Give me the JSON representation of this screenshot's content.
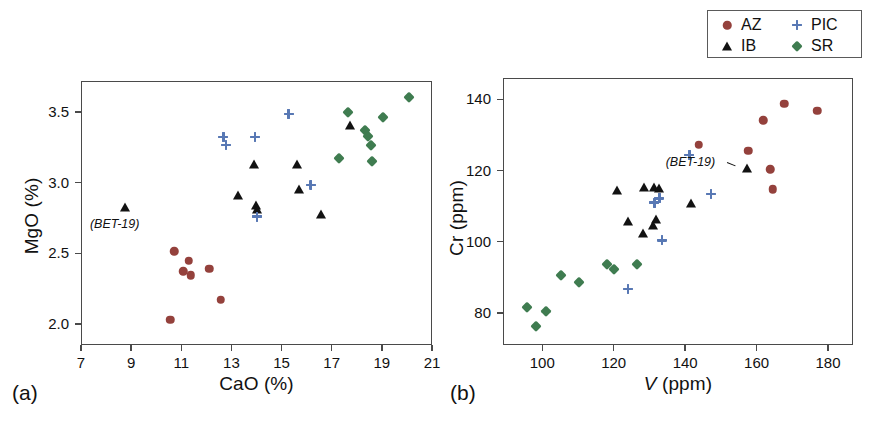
{
  "figure": {
    "panel_labels": {
      "a": "(a)",
      "b": "(b)"
    }
  },
  "legend": {
    "position": "top-right",
    "entries": [
      {
        "label": "AZ",
        "marker": "circle",
        "color": "#94413c"
      },
      {
        "label": "PIC",
        "marker": "plus",
        "color": "#5878b4"
      },
      {
        "label": "IB",
        "marker": "triangle",
        "color": "#121212"
      },
      {
        "label": "SR",
        "marker": "diamond",
        "color": "#3f7c50"
      }
    ]
  },
  "chart_data": [
    {
      "panel": "(a)",
      "type": "scatter",
      "title": "",
      "xlabel": "CaO (%)",
      "ylabel": "MgO (%)",
      "xlim": [
        7,
        21
      ],
      "ylim": [
        1.85,
        3.72
      ],
      "xticks": [
        7,
        9,
        11,
        13,
        15,
        17,
        19,
        21
      ],
      "yticks": [
        2.0,
        2.5,
        3.0,
        3.5
      ],
      "xtick_labels": [
        "7",
        "9",
        "11",
        "13",
        "15",
        "17",
        "19",
        "21"
      ],
      "ytick_labels": [
        "2.0",
        "2.5",
        "3.0",
        "3.5"
      ],
      "grid": false,
      "annotations": [
        {
          "text": "(BET-19)",
          "x": 8.75,
          "y": 2.7
        }
      ],
      "series": [
        {
          "name": "AZ",
          "marker": "circle",
          "color": "#94413c",
          "points": [
            [
              10.72,
              2.515
            ],
            [
              11.3,
              2.448
            ],
            [
              11.08,
              2.372
            ],
            [
              11.38,
              2.345
            ],
            [
              12.12,
              2.39
            ],
            [
              12.57,
              2.172
            ],
            [
              10.55,
              2.03
            ]
          ]
        },
        {
          "name": "IB",
          "marker": "triangle",
          "color": "#121212",
          "points": [
            [
              8.76,
              2.825
            ],
            [
              13.25,
              2.915
            ],
            [
              13.92,
              3.13
            ],
            [
              13.97,
              2.845
            ],
            [
              14.03,
              2.815
            ],
            [
              15.62,
              3.135
            ],
            [
              15.7,
              2.955
            ],
            [
              16.58,
              2.78
            ],
            [
              17.72,
              3.41
            ]
          ]
        },
        {
          "name": "PIC",
          "marker": "plus",
          "color": "#5878b4",
          "points": [
            [
              12.68,
              3.325
            ],
            [
              12.78,
              3.265
            ],
            [
              13.95,
              3.325
            ],
            [
              14.03,
              2.76
            ],
            [
              15.28,
              3.485
            ],
            [
              16.16,
              2.985
            ]
          ]
        },
        {
          "name": "SR",
          "marker": "diamond",
          "color": "#3f7c50",
          "points": [
            [
              17.3,
              3.175
            ],
            [
              17.63,
              3.5
            ],
            [
              18.32,
              3.375
            ],
            [
              18.45,
              3.33
            ],
            [
              18.55,
              3.265
            ],
            [
              18.62,
              3.15
            ],
            [
              19.05,
              3.465
            ],
            [
              20.08,
              3.61
            ]
          ]
        }
      ]
    },
    {
      "panel": "(b)",
      "type": "scatter",
      "title": "",
      "xlabel": "V (ppm)",
      "ylabel": "Cr (ppm)",
      "xlim": [
        89,
        187
      ],
      "ylim": [
        71,
        146
      ],
      "xticks": [
        100,
        120,
        140,
        160,
        180
      ],
      "yticks": [
        80,
        100,
        120,
        140
      ],
      "xtick_labels": [
        "100",
        "120",
        "140",
        "160",
        "180"
      ],
      "ytick_labels": [
        "80",
        "100",
        "120",
        "140"
      ],
      "grid": false,
      "annotations": [
        {
          "text": "(BET-19)",
          "x": 150.5,
          "y": 122.0
        }
      ],
      "series": [
        {
          "name": "AZ",
          "marker": "circle",
          "color": "#94413c",
          "points": [
            [
              143.8,
              127.2
            ],
            [
              157.6,
              125.6
            ],
            [
              161.8,
              134.1
            ],
            [
              167.8,
              138.8
            ],
            [
              177.0,
              136.8
            ],
            [
              163.8,
              120.3
            ],
            [
              164.5,
              114.8
            ]
          ]
        },
        {
          "name": "IB",
          "marker": "triangle",
          "color": "#121212",
          "points": [
            [
              120.8,
              114.6
            ],
            [
              128.6,
              115.4
            ],
            [
              131.3,
              115.4
            ],
            [
              132.7,
              115.2
            ],
            [
              123.9,
              105.8
            ],
            [
              131.8,
              106.3
            ],
            [
              131.0,
              104.8
            ],
            [
              128.3,
              102.6
            ],
            [
              141.6,
              110.8
            ],
            [
              157.4,
              120.8
            ]
          ]
        },
        {
          "name": "PIC",
          "marker": "plus",
          "color": "#5878b4",
          "points": [
            [
              141.2,
              124.4
            ],
            [
              147.2,
              113.4
            ],
            [
              132.8,
              112.2
            ],
            [
              131.4,
              111.0
            ],
            [
              133.6,
              100.4
            ],
            [
              124.0,
              86.8
            ]
          ]
        },
        {
          "name": "SR",
          "marker": "diamond",
          "color": "#3f7c50",
          "points": [
            [
              118.0,
              93.8
            ],
            [
              120.2,
              92.4
            ],
            [
              126.6,
              93.8
            ],
            [
              110.2,
              88.8
            ],
            [
              105.2,
              90.6
            ],
            [
              101.0,
              80.6
            ],
            [
              95.8,
              81.6
            ],
            [
              98.2,
              76.2
            ]
          ]
        }
      ]
    }
  ]
}
